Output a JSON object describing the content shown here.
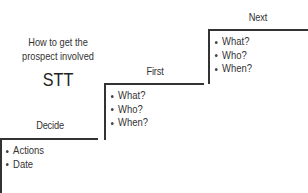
{
  "intro": {
    "question_line1": "How to get the",
    "question_line2": "prospect involved",
    "acronym": "STT"
  },
  "steps": [
    {
      "title": "Decide",
      "bullets": [
        "Actions",
        "Date"
      ]
    },
    {
      "title": "First",
      "bullets": [
        "What?",
        "Who?",
        "When?"
      ]
    },
    {
      "title": "Next",
      "bullets": [
        "What?",
        "Who?",
        "When?"
      ]
    }
  ],
  "colors": {
    "line": "#333333",
    "text": "#333333",
    "background": "#ffffff"
  }
}
